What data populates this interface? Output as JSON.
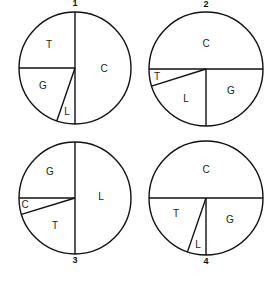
{
  "chart_data": [
    {
      "type": "pie",
      "title": "1",
      "center": [
        75,
        68
      ],
      "radius": 56,
      "title_pos": [
        75,
        4
      ],
      "slices": [
        {
          "label": "C",
          "value": 50,
          "start": 0,
          "end": 180,
          "label_pos": [
            104,
            69
          ]
        },
        {
          "label": "L",
          "value": 5,
          "start": 180,
          "end": 199,
          "label_pos": [
            67,
            112
          ]
        },
        {
          "label": "G",
          "value": 20,
          "start": 199,
          "end": 270,
          "label_pos": [
            43,
            86
          ]
        },
        {
          "label": "T",
          "value": 25,
          "start": 270,
          "end": 360,
          "label_pos": [
            49,
            45
          ]
        }
      ]
    },
    {
      "type": "pie",
      "title": "2",
      "center": [
        206,
        69
      ],
      "radius": 57,
      "title_pos": [
        206,
        5
      ],
      "slices": [
        {
          "label": "C",
          "value": 50,
          "start": 270,
          "end": 450,
          "label_pos": [
            206,
            44
          ]
        },
        {
          "label": "G",
          "value": 25,
          "start": 90,
          "end": 180,
          "label_pos": [
            231,
            91
          ]
        },
        {
          "label": "L",
          "value": 20,
          "start": 180,
          "end": 252.5,
          "label_pos": [
            186,
            99
          ]
        },
        {
          "label": "T",
          "value": 5,
          "start": 252.5,
          "end": 270,
          "label_pos": [
            157,
            77
          ]
        }
      ]
    },
    {
      "type": "pie",
      "title": "3",
      "center": [
        75,
        198
      ],
      "radius": 56,
      "title_pos": [
        75,
        261
      ],
      "slices": [
        {
          "label": "L",
          "value": 50,
          "start": 0,
          "end": 180,
          "label_pos": [
            101,
            197
          ]
        },
        {
          "label": "T",
          "value": 20,
          "start": 180,
          "end": 253,
          "label_pos": [
            55,
            226
          ]
        },
        {
          "label": "C",
          "value": 5,
          "start": 253,
          "end": 270,
          "label_pos": [
            25,
            205
          ]
        },
        {
          "label": "G",
          "value": 25,
          "start": 270,
          "end": 360,
          "label_pos": [
            50,
            172
          ]
        }
      ]
    },
    {
      "type": "pie",
      "title": "4",
      "center": [
        206,
        198
      ],
      "radius": 57,
      "title_pos": [
        206,
        262
      ],
      "slices": [
        {
          "label": "C",
          "value": 50,
          "start": 270,
          "end": 450,
          "label_pos": [
            206,
            170
          ]
        },
        {
          "label": "G",
          "value": 25,
          "start": 90,
          "end": 180,
          "label_pos": [
            230,
            220
          ]
        },
        {
          "label": "L",
          "value": 5,
          "start": 180,
          "end": 199,
          "label_pos": [
            198,
            245
          ]
        },
        {
          "label": "T",
          "value": 20,
          "start": 199,
          "end": 270,
          "label_pos": [
            176,
            214
          ]
        }
      ]
    }
  ]
}
